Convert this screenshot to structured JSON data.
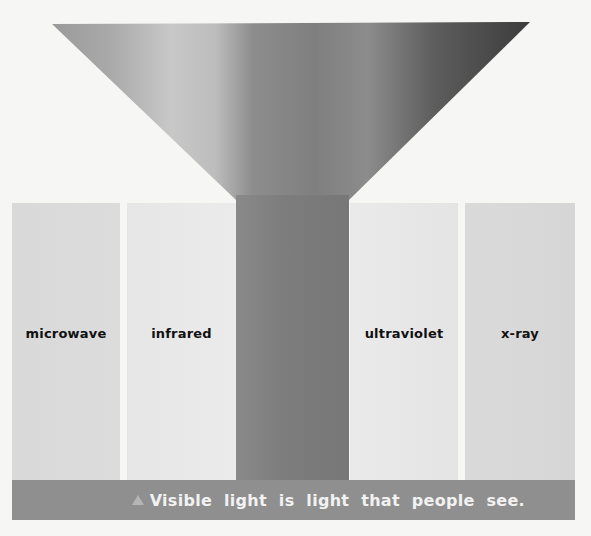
{
  "diagram": {
    "funnel": {
      "description": "Gray gradient funnel narrowing into a central column representing visible light"
    },
    "panels": [
      {
        "label": "microwave",
        "color": "#d9d9d9"
      },
      {
        "label": "infrared",
        "color": "#e8e8e8"
      },
      {
        "label": "ultraviolet",
        "color": "#e7e7e7"
      },
      {
        "label": "x-ray",
        "color": "#d8d8d8"
      }
    ],
    "caption": {
      "icon": "triangle-icon",
      "text": "Visible light is light that people see.",
      "background": "#8f8f8f"
    }
  }
}
